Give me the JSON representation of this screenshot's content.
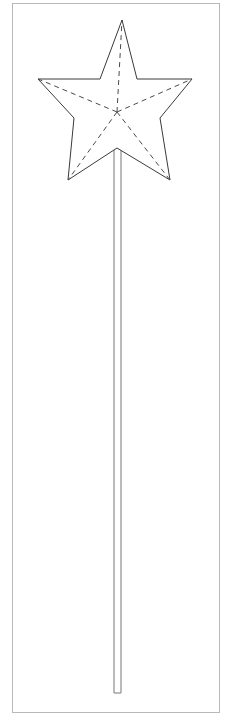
{
  "document": {
    "title": "Star Wand Craft Template",
    "kind": "printable-outline-template",
    "canvas": {
      "width": 234,
      "height": 723,
      "background": "#ffffff"
    }
  },
  "style": {
    "page_border_color": "#b8b8b8",
    "page_border_width": 1,
    "outline_color": "#3a3a3a",
    "outline_width": 1,
    "dashed_color": "#4a4a4a",
    "dashed_width": 1,
    "dash_pattern": "5 4",
    "stick_color": "#8c8c8c",
    "stick_width": 1.2,
    "fill_color": "#ffffff"
  },
  "page_border": {
    "name": "page-border",
    "x": 12,
    "y": 3,
    "width": 208,
    "height": 710
  },
  "star": {
    "name": "star-outline",
    "label": "five-pointed star",
    "center": {
      "x": 117,
      "y": 112
    },
    "outer_points": [
      {
        "name": "top",
        "x": 122,
        "y": 20
      },
      {
        "name": "right",
        "x": 192,
        "y": 79
      },
      {
        "name": "bottom-right",
        "x": 170,
        "y": 180
      },
      {
        "name": "bottom-left",
        "x": 68,
        "y": 180
      },
      {
        "name": "left",
        "x": 38,
        "y": 79
      }
    ],
    "inner_points": [
      {
        "name": "upper-right",
        "x": 137,
        "y": 79
      },
      {
        "name": "right-lower",
        "x": 160,
        "y": 118
      },
      {
        "name": "bottom",
        "x": 117,
        "y": 148
      },
      {
        "name": "left-lower",
        "x": 74,
        "y": 118
      },
      {
        "name": "upper-left",
        "x": 100,
        "y": 79
      }
    ],
    "outline_path": "M 122 20 L 137 79 L 192 79 L 160 118 L 170 180 L 117 148 L 68 180 L 74 118 L 38 79 L 100 79 Z"
  },
  "fold_lines": {
    "name": "star-fold-lines",
    "label": "dashed fold lines from center to each point",
    "from": {
      "x": 117,
      "y": 112
    },
    "to_outer": [
      {
        "x": 122,
        "y": 20
      },
      {
        "x": 192,
        "y": 79
      },
      {
        "x": 170,
        "y": 180
      },
      {
        "x": 68,
        "y": 180
      },
      {
        "x": 38,
        "y": 79
      }
    ]
  },
  "handle": {
    "name": "wand-stick",
    "label": "wand handle stick",
    "left_x": 114,
    "right_x": 121,
    "top_y": 148,
    "bottom_y": 693,
    "width": 7,
    "length": 545
  }
}
